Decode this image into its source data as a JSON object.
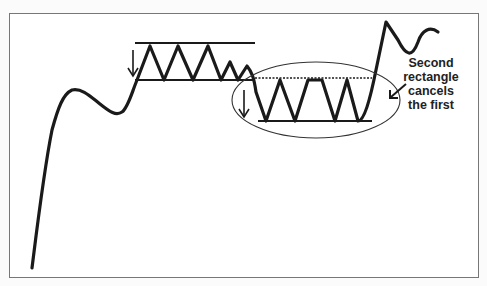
{
  "diagram": {
    "type": "price-chart-pattern",
    "annotation": {
      "lines": [
        "Second",
        "rectangle",
        "cancels",
        "the first"
      ]
    },
    "elements": {
      "first_rectangle": {
        "top_y": 43,
        "bottom_y": 80,
        "x_start": 135,
        "x_end": 255
      },
      "second_rectangle": {
        "top_y": 78,
        "bottom_y": 121,
        "x_start": 255,
        "x_end": 372,
        "top_line_style": "dotted"
      },
      "highlight_ellipse": {
        "cx": 316,
        "cy": 100,
        "rx": 84,
        "ry": 38
      }
    },
    "colors": {
      "line": "#1a1a1a",
      "frame": "#777777",
      "background": "#ffffff"
    }
  }
}
